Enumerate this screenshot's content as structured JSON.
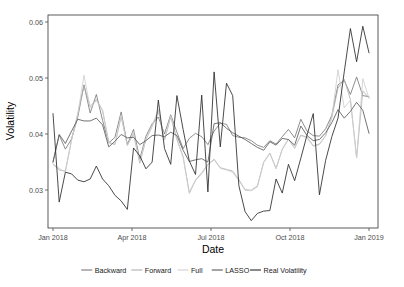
{
  "figure": {
    "background_color": "#ffffff",
    "panel": {
      "x": 48,
      "y": 15,
      "width": 330,
      "height": 213,
      "border_color": "#333333",
      "grid": false
    }
  },
  "axes": {
    "x": {
      "label": "Date",
      "ticks": [
        "Jan 2018",
        "Apr 2018",
        "Jul 2018",
        "Oct 2018",
        "Jan 2019"
      ],
      "tick_positions_px": [
        53,
        132,
        211,
        290,
        369
      ],
      "domain": [
        "2018-01-01",
        "2019-01-01"
      ]
    },
    "y": {
      "label": "Volatility",
      "ticks": [
        "0.03",
        "0.04",
        "0.05",
        "0.06"
      ],
      "tick_values": [
        0.03,
        0.04,
        0.05,
        0.06
      ],
      "tick_positions_px": [
        190,
        134,
        78,
        22
      ],
      "limits": [
        0.0235,
        0.0613
      ]
    }
  },
  "legend": {
    "position": "bottom",
    "entries": [
      {
        "label": "Backward",
        "color": "#7a7a7a"
      },
      {
        "label": "Forward",
        "color": "#b0b0b0"
      },
      {
        "label": "Full",
        "color": "#cfcfcf"
      },
      {
        "label": "LASSO",
        "color": "#5a5a5a"
      },
      {
        "label": "Real Volatility",
        "color": "#2b2b2b"
      }
    ]
  },
  "chart_data": {
    "type": "line",
    "title": "",
    "xlabel": "Date",
    "ylabel": "Volatility",
    "xlim": [
      "2018-01-01",
      "2019-01-01"
    ],
    "ylim": [
      0.0235,
      0.0613
    ],
    "grid": false,
    "legend_position": "bottom",
    "x": [
      "2018-01-05",
      "2018-01-12",
      "2018-01-19",
      "2018-01-26",
      "2018-02-02",
      "2018-02-09",
      "2018-02-16",
      "2018-02-23",
      "2018-03-02",
      "2018-03-09",
      "2018-03-16",
      "2018-03-23",
      "2018-03-30",
      "2018-04-06",
      "2018-04-13",
      "2018-04-20",
      "2018-04-27",
      "2018-05-04",
      "2018-05-11",
      "2018-05-18",
      "2018-05-25",
      "2018-06-01",
      "2018-06-08",
      "2018-06-15",
      "2018-06-22",
      "2018-06-29",
      "2018-07-06",
      "2018-07-13",
      "2018-07-20",
      "2018-07-27",
      "2018-08-03",
      "2018-08-10",
      "2018-08-17",
      "2018-08-24",
      "2018-08-31",
      "2018-09-07",
      "2018-09-14",
      "2018-09-21",
      "2018-09-28",
      "2018-10-05",
      "2018-10-12",
      "2018-10-19",
      "2018-10-26",
      "2018-11-02",
      "2018-11-09",
      "2018-11-16",
      "2018-11-23",
      "2018-11-30",
      "2018-12-07",
      "2018-12-14",
      "2018-12-21",
      "2018-12-28"
    ],
    "series": [
      {
        "name": "Backward",
        "color": "#7a7a7a",
        "values": [
          0.0352,
          0.04,
          0.0375,
          0.0393,
          0.0432,
          0.0489,
          0.0439,
          0.0472,
          0.0426,
          0.0386,
          0.0396,
          0.0441,
          0.0383,
          0.041,
          0.0357,
          0.0398,
          0.042,
          0.0432,
          0.0402,
          0.0436,
          0.0405,
          0.0376,
          0.0394,
          0.0403,
          0.0397,
          0.0383,
          0.0407,
          0.0421,
          0.0419,
          0.0399,
          0.0396,
          0.0395,
          0.039,
          0.0382,
          0.0378,
          0.039,
          0.0384,
          0.0397,
          0.041,
          0.0395,
          0.0428,
          0.0407,
          0.0399,
          0.0398,
          0.0411,
          0.0435,
          0.0489,
          0.0497,
          0.0472,
          0.0503,
          0.047,
          0.0468
        ]
      },
      {
        "name": "Forward",
        "color": "#b0b0b0",
        "values": [
          0.0348,
          0.0338,
          0.0336,
          0.0392,
          0.0438,
          0.0487,
          0.0451,
          0.0463,
          0.0444,
          0.0387,
          0.0383,
          0.0433,
          0.0382,
          0.0402,
          0.035,
          0.0392,
          0.0415,
          0.0443,
          0.0391,
          0.0432,
          0.0392,
          0.0362,
          0.0298,
          0.032,
          0.0333,
          0.0348,
          0.0357,
          0.0342,
          0.0339,
          0.0336,
          0.0321,
          0.0303,
          0.0302,
          0.031,
          0.0352,
          0.0368,
          0.0341,
          0.0375,
          0.0393,
          0.0377,
          0.04,
          0.0396,
          0.0381,
          0.0384,
          0.0399,
          0.0432,
          0.0483,
          0.0499,
          0.0463,
          0.036,
          0.0478,
          0.0466
        ]
      },
      {
        "name": "Full",
        "color": "#cfcfcf",
        "values": [
          0.0349,
          0.0341,
          0.0334,
          0.0391,
          0.0437,
          0.0506,
          0.0448,
          0.0461,
          0.0443,
          0.0386,
          0.0384,
          0.0435,
          0.0381,
          0.0403,
          0.0352,
          0.0393,
          0.0417,
          0.0445,
          0.0392,
          0.0434,
          0.0393,
          0.036,
          0.0296,
          0.0319,
          0.0331,
          0.0347,
          0.0356,
          0.0341,
          0.0338,
          0.0334,
          0.0319,
          0.0302,
          0.0301,
          0.0308,
          0.0351,
          0.0367,
          0.034,
          0.0374,
          0.0392,
          0.0376,
          0.0399,
          0.0395,
          0.038,
          0.0383,
          0.0398,
          0.0431,
          0.0516,
          0.0448,
          0.0462,
          0.0359,
          0.05,
          0.0465
        ]
      },
      {
        "name": "LASSO",
        "color": "#5a5a5a",
        "values": [
          0.0352,
          0.0401,
          0.0385,
          0.0407,
          0.0428,
          0.0425,
          0.0425,
          0.043,
          0.0418,
          0.0379,
          0.0389,
          0.0401,
          0.0395,
          0.0396,
          0.0383,
          0.039,
          0.0399,
          0.04,
          0.0397,
          0.0405,
          0.0399,
          0.0373,
          0.0353,
          0.0356,
          0.0358,
          0.0352,
          0.042,
          0.0422,
          0.0412,
          0.0404,
          0.0398,
          0.0392,
          0.0385,
          0.0378,
          0.0373,
          0.0388,
          0.0382,
          0.0394,
          0.0392,
          0.0382,
          0.0416,
          0.0399,
          0.039,
          0.0392,
          0.0404,
          0.0422,
          0.0445,
          0.043,
          0.0442,
          0.0458,
          0.0444,
          0.0403
        ]
      },
      {
        "name": "Real Volatility",
        "color": "#2b2b2b",
        "values": [
          0.0438,
          0.0281,
          0.0334,
          0.0331,
          0.032,
          0.0317,
          0.0322,
          0.0345,
          0.0322,
          0.031,
          0.0293,
          0.0283,
          0.0268,
          0.0377,
          0.0363,
          0.034,
          0.0352,
          0.0462,
          0.0376,
          0.0348,
          0.047,
          0.041,
          0.0354,
          0.033,
          0.0471,
          0.0299,
          0.0512,
          0.0379,
          0.0492,
          0.047,
          0.031,
          0.0264,
          0.0248,
          0.0261,
          0.0265,
          0.0266,
          0.0322,
          0.0297,
          0.0348,
          0.0319,
          0.0359,
          0.04,
          0.0438,
          0.0294,
          0.0355,
          0.0397,
          0.043,
          0.0512,
          0.0589,
          0.053,
          0.0593,
          0.0546
        ]
      }
    ]
  }
}
